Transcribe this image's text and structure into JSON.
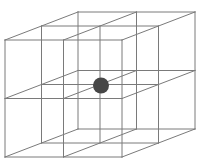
{
  "diagram": {
    "type": "3d-wireframe-lattice",
    "grid": {
      "cells_x": 2,
      "cells_y": 2,
      "cells_z": 2
    },
    "projection": {
      "front_origin": [
        5,
        40
      ],
      "cell_size": 58.5,
      "depth_offset_per_cell": [
        36.5,
        -14
      ]
    },
    "colors": {
      "background": "#ffffff",
      "edge": "#7a7a7a",
      "point": "#474747"
    },
    "edge_width": 1,
    "center_point": {
      "label": "body-center atom",
      "cx": 101,
      "cy": 85.5,
      "r": 8
    }
  }
}
